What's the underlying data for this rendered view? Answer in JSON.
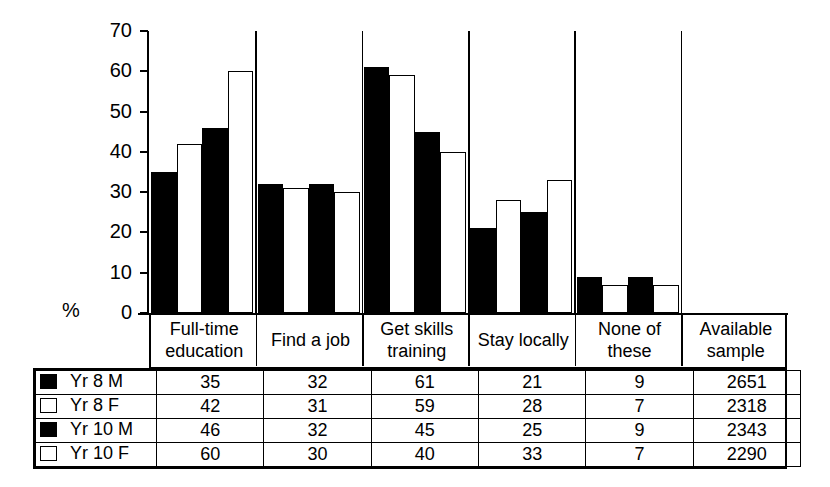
{
  "chart_data": {
    "type": "bar",
    "title": "",
    "xlabel": "",
    "ylabel": "%",
    "ylim": [
      0,
      70
    ],
    "yticks": [
      0,
      10,
      20,
      30,
      40,
      50,
      60,
      70
    ],
    "grid": false,
    "legend_position": "table-left",
    "categories": [
      "Full-time education",
      "Find a job",
      "Get skills training",
      "Stay locally",
      "None of these"
    ],
    "series": [
      {
        "name": "Yr 8 M",
        "fill": "black",
        "values": [
          35,
          32,
          61,
          21,
          9
        ],
        "available_sample": 2651
      },
      {
        "name": "Yr 8 F",
        "fill": "white",
        "values": [
          42,
          31,
          59,
          28,
          7
        ],
        "available_sample": 2318
      },
      {
        "name": "Yr 10 M",
        "fill": "black",
        "values": [
          46,
          32,
          45,
          25,
          9
        ],
        "available_sample": 2343
      },
      {
        "name": "Yr 10 F",
        "fill": "white",
        "values": [
          60,
          30,
          40,
          33,
          7
        ],
        "available_sample": 2290
      }
    ]
  },
  "axis": {
    "unit_label": "%",
    "ticks": [
      "70",
      "60",
      "50",
      "40",
      "30",
      "20",
      "10",
      "0"
    ]
  },
  "category_headers": [
    {
      "line1": "Full-time",
      "line2": "education"
    },
    {
      "line1": "Find a job",
      "line2": ""
    },
    {
      "line1": "Get skills",
      "line2": "training"
    },
    {
      "line1": "Stay locally",
      "line2": ""
    },
    {
      "line1": "None of these",
      "line2": ""
    },
    {
      "line1": "Available",
      "line2": "sample"
    }
  ],
  "table": {
    "rows": [
      {
        "swatch": "filled",
        "label": "Yr 8 M",
        "cells": [
          "35",
          "32",
          "61",
          "21",
          "9",
          "2651"
        ]
      },
      {
        "swatch": "hollow",
        "label": "Yr 8 F",
        "cells": [
          "42",
          "31",
          "59",
          "28",
          "7",
          "2318"
        ]
      },
      {
        "swatch": "filled",
        "label": "Yr 10 M",
        "cells": [
          "46",
          "32",
          "45",
          "25",
          "9",
          "2343"
        ]
      },
      {
        "swatch": "hollow",
        "label": "Yr 10 F",
        "cells": [
          "60",
          "30",
          "40",
          "33",
          "7",
          "2290"
        ]
      }
    ]
  },
  "colors": {
    "ink": "#000000",
    "paper": "#ffffff"
  }
}
